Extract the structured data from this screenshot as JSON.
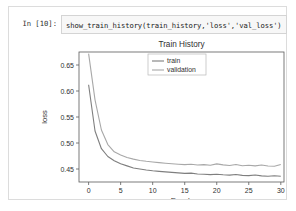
{
  "notebook": {
    "prompt_label": "In [10]:",
    "code": "show_train_history(train_history,'loss','val_loss')"
  },
  "colors": {
    "cell_border": "#dcdcdc",
    "code_bg": "#f7f7f7",
    "code_border": "#d4d4d4",
    "train_line": "#7f7f7f",
    "validation_line": "#a8a8a8",
    "axis": "#5a5a5a",
    "text": "#303030"
  },
  "chart_data": {
    "type": "line",
    "title": "Train History",
    "xlabel": "Epoch",
    "ylabel": "loss",
    "xlim": [
      -1.5,
      30.5
    ],
    "ylim": [
      0.425,
      0.675
    ],
    "xticks": [
      0,
      5,
      10,
      15,
      20,
      25,
      30
    ],
    "xticklabels": [
      "0",
      "5",
      "10",
      "15",
      "20",
      "25",
      "30"
    ],
    "yticks": [
      0.45,
      0.5,
      0.55,
      0.6,
      0.65
    ],
    "yticklabels": [
      "0.45",
      "0.50",
      "0.55",
      "0.60",
      "0.65"
    ],
    "grid": false,
    "legend_position": "upper right",
    "x": [
      0,
      1,
      2,
      3,
      4,
      5,
      6,
      7,
      8,
      9,
      10,
      11,
      12,
      13,
      14,
      15,
      16,
      17,
      18,
      19,
      20,
      21,
      22,
      23,
      24,
      25,
      26,
      27,
      28,
      29,
      30
    ],
    "series": [
      {
        "name": "train",
        "color": "#7f7f7f",
        "values": [
          0.612,
          0.523,
          0.489,
          0.474,
          0.466,
          0.46,
          0.456,
          0.452,
          0.45,
          0.448,
          0.4465,
          0.4455,
          0.4445,
          0.4435,
          0.4425,
          0.4415,
          0.442,
          0.4405,
          0.4398,
          0.4392,
          0.44,
          0.4388,
          0.4382,
          0.4395,
          0.4378,
          0.4372,
          0.4385,
          0.4368,
          0.4362,
          0.437,
          0.436
        ]
      },
      {
        "name": "validation",
        "color": "#a8a8a8",
        "values": [
          0.672,
          0.583,
          0.525,
          0.497,
          0.483,
          0.477,
          0.472,
          0.469,
          0.4665,
          0.4648,
          0.4635,
          0.4622,
          0.461,
          0.46,
          0.4592,
          0.4585,
          0.459,
          0.4578,
          0.4585,
          0.4572,
          0.4598,
          0.458,
          0.4568,
          0.4588,
          0.4562,
          0.4572,
          0.456,
          0.4578,
          0.4558,
          0.4552,
          0.4585
        ]
      }
    ]
  }
}
